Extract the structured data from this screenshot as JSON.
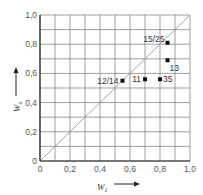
{
  "chart_data": {
    "type": "scatter",
    "title": "",
    "xlabel": "W1",
    "ylabel": "Wa",
    "xlim": [
      0,
      1.0
    ],
    "ylim": [
      0,
      1.0
    ],
    "grid": true,
    "grid_step": 0.1,
    "x_ticks": [
      "0",
      "0,2",
      "0,4",
      "0,6",
      "0,8",
      "1,0"
    ],
    "y_ticks": [
      "0",
      "0,2",
      "0,4",
      "0,6",
      "0,8",
      "1,0"
    ],
    "reference_line": {
      "name": "diagonal",
      "from": [
        0,
        0
      ],
      "to": [
        1,
        1
      ]
    },
    "points": [
      {
        "label": "12/14",
        "x": 0.55,
        "y": 0.55,
        "label_side": "left"
      },
      {
        "label": "11",
        "x": 0.7,
        "y": 0.56,
        "label_side": "left"
      },
      {
        "label": "35",
        "x": 0.8,
        "y": 0.56,
        "label_side": "right"
      },
      {
        "label": "13",
        "x": 0.85,
        "y": 0.69,
        "label_side": "below-right"
      },
      {
        "label": "15/25",
        "x": 0.85,
        "y": 0.81,
        "label_side": "above-left"
      }
    ],
    "point_color": "#111111",
    "grid_color": "#777777",
    "diagonal_color": "#999999"
  }
}
